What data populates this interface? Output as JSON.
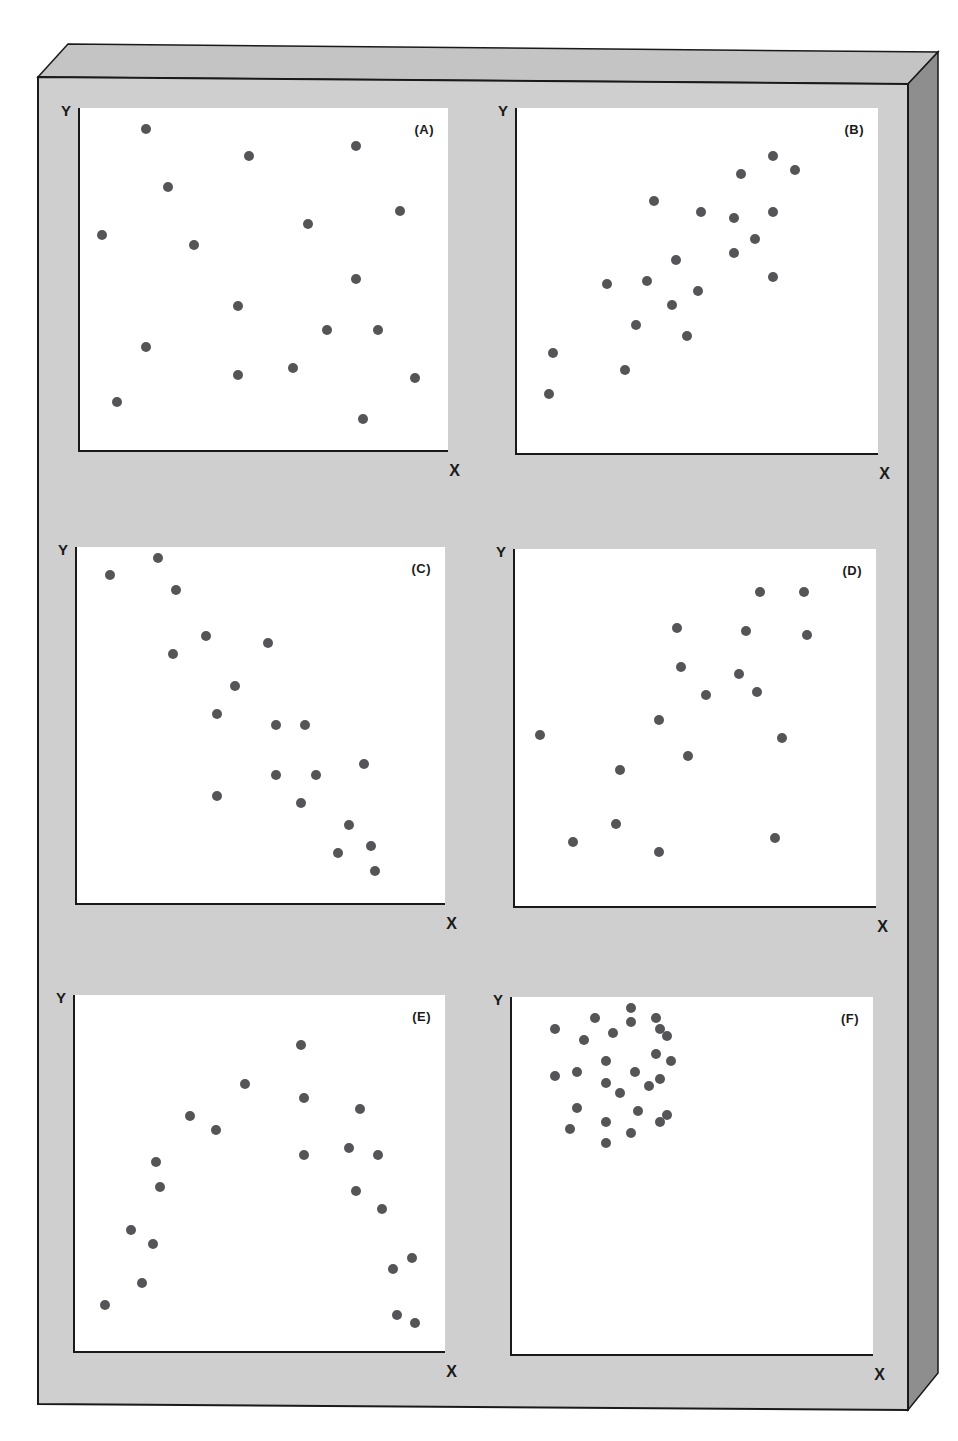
{
  "colors": {
    "board_front": "#cfcfcf",
    "board_top": "#c4c4c4",
    "board_side": "#8e8e8e",
    "panel_bg": "#ffffff",
    "dot": "#555558",
    "axis": "#1a1a1a"
  },
  "chart_data": [
    {
      "type": "scatter",
      "title": "(A)",
      "xlabel": "X",
      "ylabel": "Y",
      "grid": false,
      "description": "No correlation - random scatter",
      "points": [
        [
          0.18,
          0.94
        ],
        [
          0.46,
          0.86
        ],
        [
          0.75,
          0.89
        ],
        [
          0.24,
          0.77
        ],
        [
          0.87,
          0.7
        ],
        [
          0.62,
          0.66
        ],
        [
          0.06,
          0.63
        ],
        [
          0.31,
          0.6
        ],
        [
          0.75,
          0.5
        ],
        [
          0.43,
          0.42
        ],
        [
          0.67,
          0.35
        ],
        [
          0.81,
          0.35
        ],
        [
          0.18,
          0.3
        ],
        [
          0.43,
          0.22
        ],
        [
          0.58,
          0.24
        ],
        [
          0.91,
          0.21
        ],
        [
          0.1,
          0.14
        ],
        [
          0.77,
          0.09
        ]
      ]
    },
    {
      "type": "scatter",
      "title": "(B)",
      "xlabel": "X",
      "ylabel": "Y",
      "grid": false,
      "description": "Strong positive correlation",
      "points": [
        [
          0.71,
          0.86
        ],
        [
          0.62,
          0.81
        ],
        [
          0.77,
          0.82
        ],
        [
          0.38,
          0.73
        ],
        [
          0.51,
          0.7
        ],
        [
          0.6,
          0.68
        ],
        [
          0.71,
          0.7
        ],
        [
          0.66,
          0.62
        ],
        [
          0.6,
          0.58
        ],
        [
          0.44,
          0.56
        ],
        [
          0.71,
          0.51
        ],
        [
          0.25,
          0.49
        ],
        [
          0.36,
          0.5
        ],
        [
          0.5,
          0.47
        ],
        [
          0.43,
          0.43
        ],
        [
          0.33,
          0.37
        ],
        [
          0.47,
          0.34
        ],
        [
          0.1,
          0.29
        ],
        [
          0.3,
          0.24
        ],
        [
          0.09,
          0.17
        ]
      ]
    },
    {
      "type": "scatter",
      "title": "(C)",
      "xlabel": "X",
      "ylabel": "Y",
      "grid": false,
      "description": "Strong negative correlation",
      "points": [
        [
          0.09,
          0.92
        ],
        [
          0.22,
          0.97
        ],
        [
          0.27,
          0.88
        ],
        [
          0.35,
          0.75
        ],
        [
          0.52,
          0.73
        ],
        [
          0.26,
          0.7
        ],
        [
          0.43,
          0.61
        ],
        [
          0.38,
          0.53
        ],
        [
          0.54,
          0.5
        ],
        [
          0.62,
          0.5
        ],
        [
          0.54,
          0.36
        ],
        [
          0.65,
          0.36
        ],
        [
          0.78,
          0.39
        ],
        [
          0.38,
          0.3
        ],
        [
          0.61,
          0.28
        ],
        [
          0.74,
          0.22
        ],
        [
          0.71,
          0.14
        ],
        [
          0.8,
          0.16
        ],
        [
          0.81,
          0.09
        ]
      ]
    },
    {
      "type": "scatter",
      "title": "(D)",
      "xlabel": "X",
      "ylabel": "Y",
      "grid": false,
      "description": "Weak positive correlation",
      "points": [
        [
          0.68,
          0.88
        ],
        [
          0.8,
          0.88
        ],
        [
          0.45,
          0.78
        ],
        [
          0.64,
          0.77
        ],
        [
          0.81,
          0.76
        ],
        [
          0.46,
          0.67
        ],
        [
          0.62,
          0.65
        ],
        [
          0.53,
          0.59
        ],
        [
          0.67,
          0.6
        ],
        [
          0.4,
          0.52
        ],
        [
          0.07,
          0.48
        ],
        [
          0.74,
          0.47
        ],
        [
          0.48,
          0.42
        ],
        [
          0.29,
          0.38
        ],
        [
          0.28,
          0.23
        ],
        [
          0.16,
          0.18
        ],
        [
          0.4,
          0.15
        ],
        [
          0.72,
          0.19
        ]
      ]
    },
    {
      "type": "scatter",
      "title": "(E)",
      "xlabel": "X",
      "ylabel": "Y",
      "grid": false,
      "description": "Curvilinear (inverted-U) relationship",
      "points": [
        [
          0.61,
          0.86
        ],
        [
          0.46,
          0.75
        ],
        [
          0.62,
          0.71
        ],
        [
          0.31,
          0.66
        ],
        [
          0.38,
          0.62
        ],
        [
          0.77,
          0.68
        ],
        [
          0.62,
          0.55
        ],
        [
          0.74,
          0.57
        ],
        [
          0.82,
          0.55
        ],
        [
          0.22,
          0.53
        ],
        [
          0.23,
          0.46
        ],
        [
          0.76,
          0.45
        ],
        [
          0.83,
          0.4
        ],
        [
          0.15,
          0.34
        ],
        [
          0.21,
          0.3
        ],
        [
          0.18,
          0.19
        ],
        [
          0.08,
          0.13
        ],
        [
          0.86,
          0.23
        ],
        [
          0.91,
          0.26
        ],
        [
          0.87,
          0.1
        ],
        [
          0.92,
          0.08
        ]
      ]
    },
    {
      "type": "scatter",
      "title": "(F)",
      "xlabel": "X",
      "ylabel": "Y",
      "grid": false,
      "description": "Tight cluster in upper-left - restricted range, no clear correlation",
      "points": [
        [
          0.12,
          0.91
        ],
        [
          0.23,
          0.94
        ],
        [
          0.28,
          0.9
        ],
        [
          0.33,
          0.97
        ],
        [
          0.33,
          0.93
        ],
        [
          0.4,
          0.94
        ],
        [
          0.41,
          0.91
        ],
        [
          0.43,
          0.89
        ],
        [
          0.2,
          0.88
        ],
        [
          0.4,
          0.84
        ],
        [
          0.26,
          0.82
        ],
        [
          0.44,
          0.82
        ],
        [
          0.18,
          0.79
        ],
        [
          0.12,
          0.78
        ],
        [
          0.34,
          0.79
        ],
        [
          0.26,
          0.76
        ],
        [
          0.41,
          0.77
        ],
        [
          0.38,
          0.75
        ],
        [
          0.3,
          0.73
        ],
        [
          0.18,
          0.69
        ],
        [
          0.35,
          0.68
        ],
        [
          0.43,
          0.67
        ],
        [
          0.26,
          0.65
        ],
        [
          0.41,
          0.65
        ],
        [
          0.16,
          0.63
        ],
        [
          0.33,
          0.62
        ],
        [
          0.26,
          0.59
        ]
      ]
    }
  ],
  "panels": [
    {
      "letter": "(A)",
      "xlabel": "X",
      "ylabel": "Y"
    },
    {
      "letter": "(B)",
      "xlabel": "X",
      "ylabel": "Y"
    },
    {
      "letter": "(C)",
      "xlabel": "X",
      "ylabel": "Y"
    },
    {
      "letter": "(D)",
      "xlabel": "X",
      "ylabel": "Y"
    },
    {
      "letter": "(E)",
      "xlabel": "X",
      "ylabel": "Y"
    },
    {
      "letter": "(F)",
      "xlabel": "X",
      "ylabel": "Y"
    }
  ]
}
